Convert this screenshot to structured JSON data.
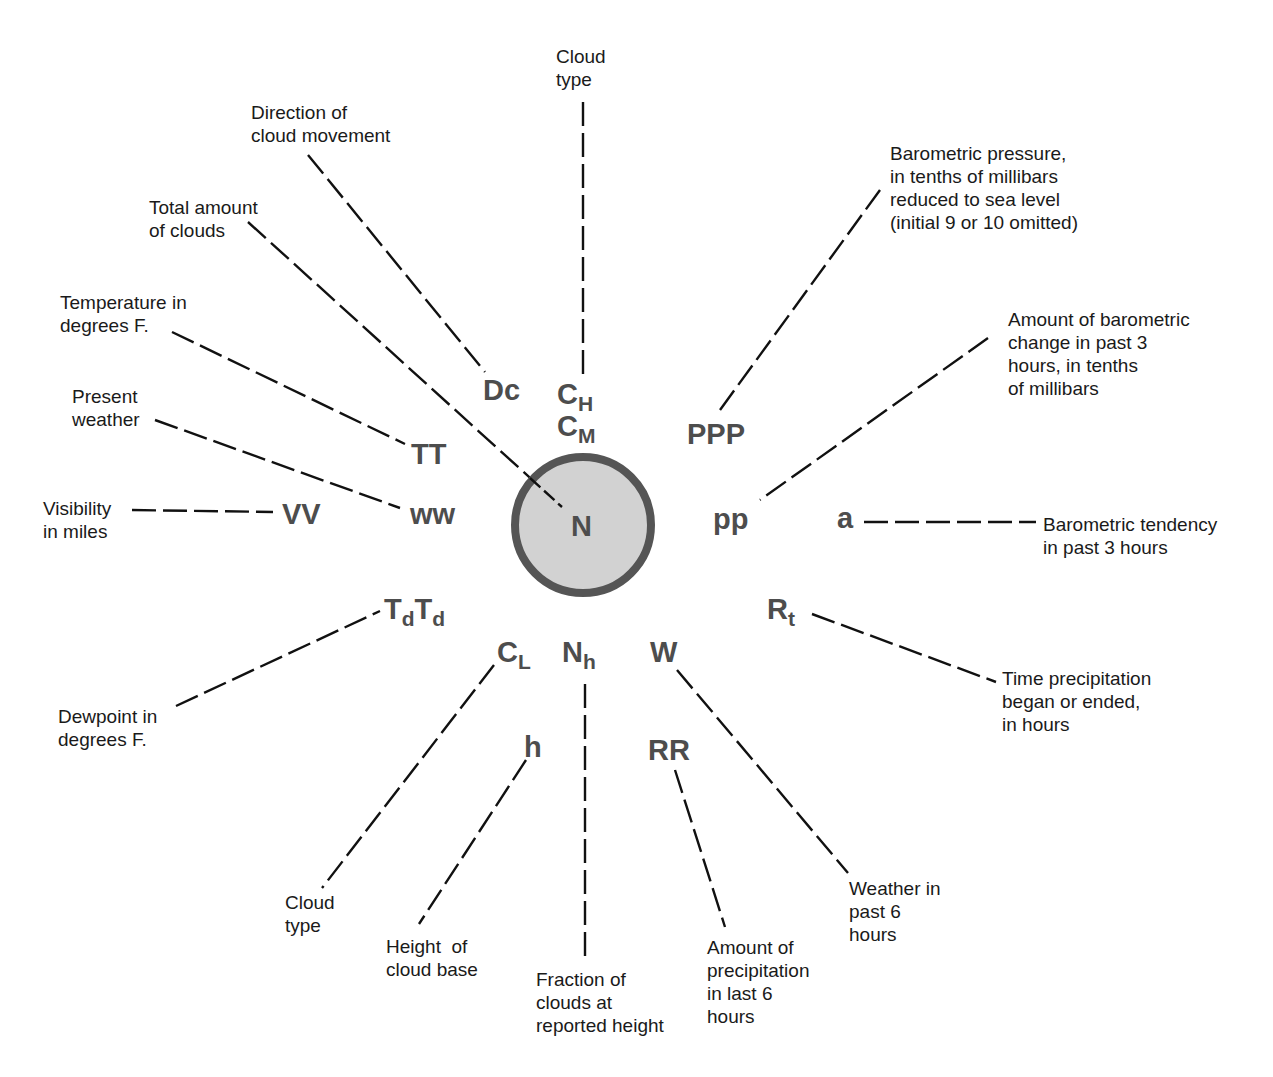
{
  "diagram": {
    "type": "station-model",
    "colors": {
      "symbol": "#4d4d4d",
      "label": "#1a1a1a",
      "circle_fill": "#d2d2d2",
      "circle_stroke": "#555555",
      "leader": "#111111"
    },
    "center": {
      "symbol": "N",
      "x": 583,
      "y": 525,
      "r": 68
    },
    "symbols": {
      "Dc": {
        "main": "Dc",
        "sub": ""
      },
      "CH": {
        "main": "C",
        "sub": "H"
      },
      "CM": {
        "main": "C",
        "sub": "M"
      },
      "PPP": {
        "main": "PPP",
        "sub": ""
      },
      "TT": {
        "main": "TT",
        "sub": ""
      },
      "ww": {
        "main": "ww",
        "sub": ""
      },
      "VV": {
        "main": "VV",
        "sub": ""
      },
      "pp": {
        "main": "pp",
        "sub": ""
      },
      "a": {
        "main": "a",
        "sub": ""
      },
      "TdTd_1": {
        "main": "T",
        "sub": "d"
      },
      "TdTd_2": {
        "main": "T",
        "sub": "d"
      },
      "Rt": {
        "main": "R",
        "sub": "t"
      },
      "CL": {
        "main": "C",
        "sub": "L"
      },
      "Nh": {
        "main": "N",
        "sub": "h"
      },
      "W": {
        "main": "W",
        "sub": ""
      },
      "h": {
        "main": "h",
        "sub": ""
      },
      "RR": {
        "main": "RR",
        "sub": ""
      }
    },
    "labels": {
      "cloud_type_high": "Cloud\ntype",
      "direction_cloud_movement": "Direction of\ncloud movement",
      "total_amount_clouds": "Total amount\nof clouds",
      "barometric_pressure": "Barometric pressure,\nin tenths of millibars\nreduced to sea level\n(initial 9 or 10 omitted)",
      "temperature": "Temperature in\ndegrees F.",
      "barometric_change": "Amount of barometric\nchange in past 3\nhours, in tenths\nof millibars",
      "present_weather": "Present\nweather",
      "visibility": "Visibility\nin miles",
      "barometric_tendency": "Barometric tendency\nin past 3 hours",
      "time_precipitation": "Time precipitation\nbegan or ended,\nin hours",
      "dewpoint": "Dewpoint in\ndegrees F.",
      "cloud_type_low": "Cloud\ntype",
      "height_cloud_base": "Height  of\ncloud base",
      "fraction_clouds": "Fraction of\nclouds at\nreported height",
      "precip_amount": "Amount of\nprecipitation\nin last 6\nhours",
      "weather_past": "Weather in\npast 6\nhours"
    }
  }
}
